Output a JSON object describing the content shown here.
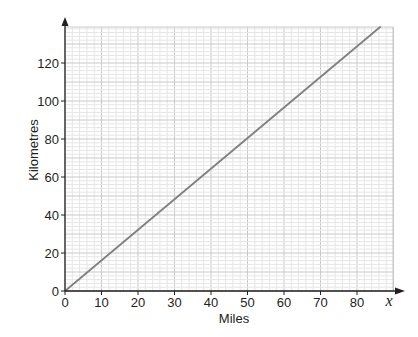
{
  "chart_data": {
    "type": "line",
    "title": "",
    "xlabel": "Miles",
    "ylabel": "Kilometres",
    "x_axis_variable": "x",
    "xlim": [
      0,
      88
    ],
    "ylim": [
      0,
      140
    ],
    "x_ticks": [
      0,
      10,
      20,
      30,
      40,
      50,
      60,
      70,
      80
    ],
    "y_ticks": [
      0,
      20,
      40,
      60,
      80,
      100,
      120
    ],
    "grid": {
      "major_x": 10,
      "minor_x": 2,
      "major_y": 10,
      "minor_y": 2
    },
    "series": [
      {
        "name": "Miles to Kilometres",
        "x": [
          0,
          86.5
        ],
        "y": [
          0,
          139.2
        ],
        "color": "#808080"
      }
    ],
    "legend": "none"
  },
  "colors": {
    "axis": "#231f20",
    "line": "#808080",
    "grid_major": "#c9c9c9",
    "grid_minor": "#e6e6e6"
  }
}
